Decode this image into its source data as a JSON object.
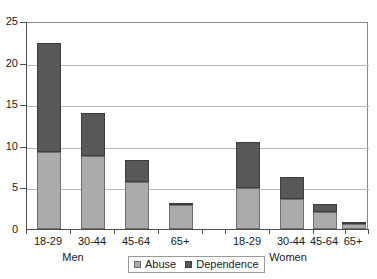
{
  "chart_data": {
    "type": "bar",
    "subtype": "stacked",
    "title": "",
    "xlabel": "",
    "ylabel": "",
    "ylim": [
      0,
      25
    ],
    "yticks": [
      0,
      5,
      10,
      15,
      20,
      25
    ],
    "grid": true,
    "legend_position": "bottom-center",
    "groups": [
      "Men",
      "Women"
    ],
    "categories": [
      "18-29",
      "30-44",
      "45-64",
      "65+",
      "18-29",
      "30-44",
      "45-64",
      "65+"
    ],
    "series": [
      {
        "name": "Abuse",
        "color": "#ababab",
        "values": [
          9.3,
          8.8,
          5.7,
          2.9,
          4.9,
          3.6,
          2.0,
          0.6
        ]
      },
      {
        "name": "Dependence",
        "color": "#585858",
        "values": [
          13.0,
          5.1,
          2.6,
          0.1,
          5.5,
          2.6,
          1.0,
          0.1
        ]
      }
    ],
    "totals": [
      22.3,
      13.9,
      8.3,
      3.0,
      10.4,
      6.2,
      3.0,
      0.7
    ],
    "bars": [
      {
        "label": "18-29",
        "group": "Men",
        "abuse": 9.3,
        "dependence": 13.0,
        "total": 22.3
      },
      {
        "label": "30-44",
        "group": "Men",
        "abuse": 8.8,
        "dependence": 5.1,
        "total": 13.9
      },
      {
        "label": "45-64",
        "group": "Men",
        "abuse": 5.7,
        "dependence": 2.6,
        "total": 8.3
      },
      {
        "label": "65+",
        "group": "Men",
        "abuse": 2.9,
        "dependence": 0.1,
        "total": 3.0
      },
      {
        "label": "18-29",
        "group": "Women",
        "abuse": 4.9,
        "dependence": 5.5,
        "total": 10.4
      },
      {
        "label": "30-44",
        "group": "Women",
        "abuse": 3.6,
        "dependence": 2.6,
        "total": 6.2
      },
      {
        "label": "45-64",
        "group": "Women",
        "abuse": 2.0,
        "dependence": 1.0,
        "total": 3.0
      },
      {
        "label": "65+",
        "group": "Women",
        "abuse": 0.6,
        "dependence": 0.1,
        "total": 0.7
      }
    ]
  },
  "axis": {
    "y_labels": [
      "0",
      "5",
      "10",
      "15",
      "20",
      "25"
    ]
  },
  "categories": {
    "men": [
      "18-29",
      "30-44",
      "45-64",
      "65+"
    ],
    "women": [
      "18-29",
      "30-44",
      "45-64",
      "65+"
    ]
  },
  "groups": {
    "men_label": "Men",
    "women_label": "Women"
  },
  "legend": {
    "items": [
      {
        "label": "Abuse",
        "color": "#ababab"
      },
      {
        "label": "Dependence",
        "color": "#585858"
      }
    ]
  },
  "colors": {
    "abuse": "#ababab",
    "dependence": "#585858",
    "grid": "#b9b9b9",
    "axis": "#4d4d4d",
    "background": "#ffffff"
  }
}
